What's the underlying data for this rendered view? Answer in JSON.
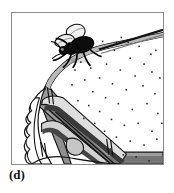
{
  "figure": {
    "panel_label": "(d)",
    "caption_text": "",
    "alt_description": "Line drawing of a mattress corner with a fly resting on the top surface near the corner; the near side is cut away to reveal interior padding layers",
    "frame": {
      "border_color": "#8a8a8a",
      "background_color": "#ffffff",
      "x": 11,
      "y": 12,
      "width": 153,
      "height": 153
    },
    "colors": {
      "ink": "#000000",
      "outline": "#111111",
      "mattress_top": "#ffffff",
      "side_panel_mid_gray": "#9a9a9a",
      "side_panel_dark_gray": "#6e6e6e",
      "side_panel_light_gray": "#c9c9c9",
      "interior_foam": "#d8d8d8",
      "shadow_gray": "#4a4a4a",
      "speckle": "#2b2b2b",
      "wing_fill": "#efefef"
    },
    "elements": [
      {
        "name": "mattress-top-surface",
        "label": "Mattress top surface"
      },
      {
        "name": "mattress-corner-piping",
        "label": "Corner piping / welt cord"
      },
      {
        "name": "mattress-side-panel",
        "label": "Mattress side panel"
      },
      {
        "name": "mattress-cutaway",
        "label": "Cut-away interior padding"
      },
      {
        "name": "mattress-tufting-marks",
        "label": "Tufting stitch marks"
      },
      {
        "name": "fly",
        "label": "Fly on mattress corner"
      },
      {
        "name": "speckle-pattern",
        "label": "Ticking speckle pattern"
      }
    ],
    "speckles": [
      [
        98,
        34
      ],
      [
        118,
        30
      ],
      [
        136,
        40
      ],
      [
        147,
        48
      ],
      [
        110,
        44
      ],
      [
        92,
        48
      ],
      [
        126,
        52
      ],
      [
        140,
        58
      ],
      [
        102,
        58
      ],
      [
        86,
        62
      ],
      [
        116,
        64
      ],
      [
        131,
        70
      ],
      [
        148,
        66
      ],
      [
        95,
        72
      ],
      [
        108,
        78
      ],
      [
        122,
        84
      ],
      [
        139,
        80
      ],
      [
        151,
        88
      ],
      [
        88,
        86
      ],
      [
        101,
        92
      ],
      [
        114,
        98
      ],
      [
        128,
        104
      ],
      [
        143,
        98
      ],
      [
        154,
        108
      ],
      [
        95,
        106
      ],
      [
        107,
        114
      ],
      [
        120,
        120
      ],
      [
        134,
        118
      ],
      [
        148,
        126
      ],
      [
        100,
        126
      ],
      [
        112,
        132
      ],
      [
        126,
        136
      ],
      [
        140,
        140
      ],
      [
        153,
        134
      ],
      [
        106,
        144
      ],
      [
        119,
        150
      ],
      [
        132,
        152
      ],
      [
        145,
        156
      ],
      [
        80,
        74
      ],
      [
        84,
        100
      ],
      [
        90,
        118
      ],
      [
        96,
        138
      ],
      [
        102,
        156
      ],
      [
        152,
        44
      ],
      [
        156,
        72
      ],
      [
        158,
        118
      ],
      [
        76,
        56
      ],
      [
        70,
        64
      ],
      [
        124,
        36
      ],
      [
        112,
        36
      ]
    ],
    "tufting_marks": [
      {
        "x": 43,
        "y": 82,
        "length": 15,
        "angle": 4
      },
      {
        "x": 47,
        "y": 82,
        "length": 15,
        "angle": 4
      },
      {
        "x": 36,
        "y": 139,
        "length": 14,
        "angle": 2
      },
      {
        "x": 40,
        "y": 139,
        "length": 14,
        "angle": 2
      },
      {
        "x": 103,
        "y": 136,
        "length": 15,
        "angle": 2
      },
      {
        "x": 107,
        "y": 136,
        "length": 15,
        "angle": 2
      }
    ]
  }
}
